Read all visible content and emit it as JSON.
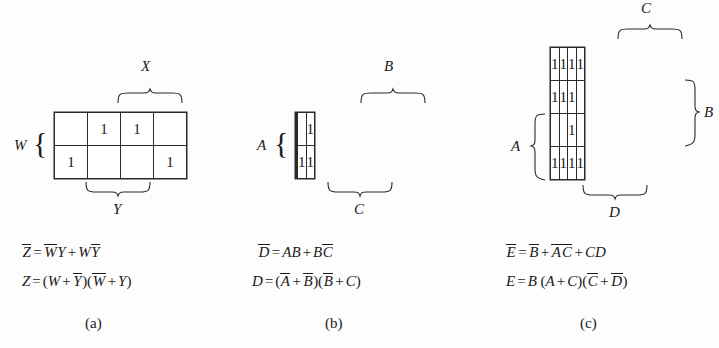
{
  "figure": {
    "background_color": "#fdfdfd",
    "line_color": "#2b2b2b",
    "text_color": "#1a1a1a"
  },
  "panels": [
    {
      "id": "a",
      "caption": "(a)",
      "kmap": {
        "rows": 2,
        "cols": 4,
        "cells": [
          [
            "",
            "1",
            "1",
            ""
          ],
          [
            "1",
            "",
            "",
            "1"
          ]
        ]
      },
      "labels": {
        "top_brace": "X",
        "bottom_brace": "Y",
        "left_label": "W",
        "left_brace_glyph": "{"
      },
      "equations": [
        {
          "lhs": "Z",
          "lhs_bar": true,
          "plain": "Z̅ = W̅Y + WY̅",
          "terms": [
            {
              "text": "W",
              "bar": true
            },
            {
              "text": "Y",
              "bar": false
            },
            {
              "op": "+"
            },
            {
              "text": "W",
              "bar": false
            },
            {
              "text": "Y",
              "bar": true
            }
          ]
        },
        {
          "lhs": "Z",
          "lhs_bar": false,
          "plain": "Z = (W + Y̅)(W̅ + Y)",
          "terms": [
            {
              "paren": "("
            },
            {
              "text": "W",
              "bar": false
            },
            {
              "op": "+"
            },
            {
              "text": "Y",
              "bar": true
            },
            {
              "paren": ")("
            },
            {
              "text": "W",
              "bar": true
            },
            {
              "op": "+"
            },
            {
              "text": "Y",
              "bar": false
            },
            {
              "paren": ")"
            }
          ]
        }
      ]
    },
    {
      "id": "b",
      "caption": "(b)",
      "kmap": {
        "rows": 2,
        "cols": 4,
        "cells": [
          [
            "",
            "",
            "",
            "1"
          ],
          [
            "",
            "",
            "1",
            "1"
          ]
        ]
      },
      "labels": {
        "top_brace": "B",
        "bottom_brace": "C",
        "left_label": "A",
        "left_brace_glyph": "{"
      },
      "equations": [
        {
          "lhs": "D",
          "lhs_bar": true,
          "plain": "D̅ = AB + BC̅",
          "terms": [
            {
              "text": "A",
              "bar": false
            },
            {
              "text": "B",
              "bar": false
            },
            {
              "op": "+"
            },
            {
              "text": "B",
              "bar": false
            },
            {
              "text": "C",
              "bar": true
            }
          ]
        },
        {
          "lhs": "D",
          "lhs_bar": false,
          "plain": "D = (A̅ + B̅)(B̅ + C)",
          "terms": [
            {
              "paren": "("
            },
            {
              "text": "A",
              "bar": true
            },
            {
              "op": "+"
            },
            {
              "text": "B",
              "bar": true
            },
            {
              "paren": ")("
            },
            {
              "text": "B",
              "bar": true
            },
            {
              "op": "+"
            },
            {
              "text": "C",
              "bar": false
            },
            {
              "paren": ")"
            }
          ]
        }
      ]
    },
    {
      "id": "c",
      "caption": "(c)",
      "kmap": {
        "rows": 4,
        "cols": 4,
        "cells": [
          [
            "1",
            "1",
            "1",
            "1"
          ],
          [
            "1",
            "1",
            "1",
            ""
          ],
          [
            "",
            "",
            "1",
            ""
          ],
          [
            "1",
            "1",
            "1",
            "1"
          ]
        ]
      },
      "labels": {
        "top_brace": "C",
        "bottom_brace": "D",
        "left_label": "A",
        "left_brace_glyph": "{",
        "right_brace_label": "B"
      },
      "equations": [
        {
          "lhs": "E",
          "lhs_bar": true,
          "plain": "E̅ = B̅ + A̅C̅ + CD",
          "terms": [
            {
              "text": "B",
              "bar": true
            },
            {
              "op": "+"
            },
            {
              "text": "A",
              "bar": true
            },
            {
              "text": "C",
              "bar": true
            },
            {
              "op": "+"
            },
            {
              "text": "C",
              "bar": false
            },
            {
              "text": "D",
              "bar": false
            }
          ]
        },
        {
          "lhs": "E",
          "lhs_bar": false,
          "plain": "E = B (A + C)(C̅ + D̅)",
          "terms": [
            {
              "text": "B",
              "bar": false
            },
            {
              "paren": "("
            },
            {
              "text": "A",
              "bar": false
            },
            {
              "op": "+"
            },
            {
              "text": "C",
              "bar": false
            },
            {
              "paren": ")("
            },
            {
              "text": "C",
              "bar": true
            },
            {
              "op": "+"
            },
            {
              "text": "D",
              "bar": true
            },
            {
              "paren": ")"
            }
          ]
        }
      ]
    }
  ]
}
